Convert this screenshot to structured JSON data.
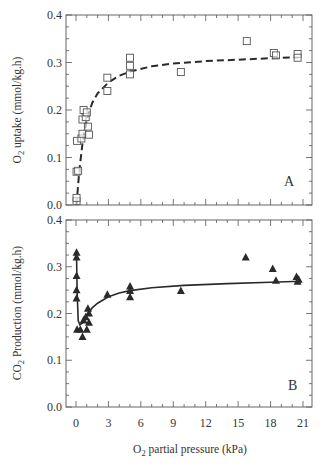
{
  "chart_data": [
    {
      "id": "A",
      "type": "scatter",
      "panel_label": "A",
      "title": "",
      "xlabel": "O2 partial pressure (kPa)",
      "ylabel": "O2 uptake (mmol/kg.h)",
      "xlim": [
        0,
        21
      ],
      "ylim": [
        0.0,
        0.4
      ],
      "yticks": [
        "0.0",
        "0.1",
        "0.2",
        "0.3",
        "0.4"
      ],
      "grid": false,
      "marker": "open-square",
      "fit_line": "dashed",
      "points": [
        {
          "x": 0.05,
          "y": 0.008
        },
        {
          "x": 0.05,
          "y": 0.015
        },
        {
          "x": 0.05,
          "y": 0.07
        },
        {
          "x": 0.2,
          "y": 0.072
        },
        {
          "x": 0.1,
          "y": 0.135
        },
        {
          "x": 0.5,
          "y": 0.14
        },
        {
          "x": 0.6,
          "y": 0.18
        },
        {
          "x": 0.6,
          "y": 0.15
        },
        {
          "x": 0.7,
          "y": 0.2
        },
        {
          "x": 0.9,
          "y": 0.185
        },
        {
          "x": 1.0,
          "y": 0.195
        },
        {
          "x": 1.1,
          "y": 0.165
        },
        {
          "x": 1.2,
          "y": 0.148
        },
        {
          "x": 2.9,
          "y": 0.268
        },
        {
          "x": 2.9,
          "y": 0.24
        },
        {
          "x": 5.0,
          "y": 0.31
        },
        {
          "x": 5.0,
          "y": 0.293
        },
        {
          "x": 5.0,
          "y": 0.275
        },
        {
          "x": 9.7,
          "y": 0.28
        },
        {
          "x": 15.8,
          "y": 0.345
        },
        {
          "x": 18.3,
          "y": 0.32
        },
        {
          "x": 18.5,
          "y": 0.315
        },
        {
          "x": 20.5,
          "y": 0.318
        },
        {
          "x": 20.5,
          "y": 0.31
        }
      ],
      "fit_curve": [
        {
          "x": 0.05,
          "y": 0.0
        },
        {
          "x": 0.3,
          "y": 0.07
        },
        {
          "x": 0.6,
          "y": 0.13
        },
        {
          "x": 1.0,
          "y": 0.18
        },
        {
          "x": 1.5,
          "y": 0.215
        },
        {
          "x": 2.0,
          "y": 0.235
        },
        {
          "x": 3.0,
          "y": 0.258
        },
        {
          "x": 4.0,
          "y": 0.272
        },
        {
          "x": 5.0,
          "y": 0.281
        },
        {
          "x": 7.0,
          "y": 0.292
        },
        {
          "x": 9.0,
          "y": 0.298
        },
        {
          "x": 12.0,
          "y": 0.303
        },
        {
          "x": 15.0,
          "y": 0.306
        },
        {
          "x": 18.0,
          "y": 0.309
        },
        {
          "x": 20.6,
          "y": 0.311
        }
      ]
    },
    {
      "id": "B",
      "type": "scatter",
      "panel_label": "B",
      "title": "",
      "xlabel": "O2 partial pressure (kPa)",
      "ylabel": "CO2 Production (mmol/kg.h)",
      "xlim": [
        0,
        21
      ],
      "ylim": [
        0.0,
        0.4
      ],
      "xticks": [
        "0",
        "3",
        "6",
        "9",
        "12",
        "15",
        "18",
        "21"
      ],
      "yticks": [
        "0.0",
        "0.1",
        "0.2",
        "0.3",
        "0.4"
      ],
      "grid": false,
      "marker": "filled-triangle",
      "fit_line": "solid",
      "points": [
        {
          "x": 0.05,
          "y": 0.33
        },
        {
          "x": 0.05,
          "y": 0.32
        },
        {
          "x": 0.05,
          "y": 0.28
        },
        {
          "x": 0.05,
          "y": 0.25
        },
        {
          "x": 0.05,
          "y": 0.232
        },
        {
          "x": 0.1,
          "y": 0.165
        },
        {
          "x": 0.4,
          "y": 0.165
        },
        {
          "x": 0.7,
          "y": 0.185
        },
        {
          "x": 0.6,
          "y": 0.15
        },
        {
          "x": 0.9,
          "y": 0.192
        },
        {
          "x": 1.0,
          "y": 0.165
        },
        {
          "x": 1.1,
          "y": 0.21
        },
        {
          "x": 1.2,
          "y": 0.2
        },
        {
          "x": 1.2,
          "y": 0.18
        },
        {
          "x": 2.9,
          "y": 0.24
        },
        {
          "x": 5.0,
          "y": 0.258
        },
        {
          "x": 5.0,
          "y": 0.248
        },
        {
          "x": 5.0,
          "y": 0.235
        },
        {
          "x": 9.7,
          "y": 0.248
        },
        {
          "x": 15.7,
          "y": 0.32
        },
        {
          "x": 18.2,
          "y": 0.295
        },
        {
          "x": 18.5,
          "y": 0.27
        },
        {
          "x": 20.4,
          "y": 0.278
        },
        {
          "x": 20.6,
          "y": 0.272
        },
        {
          "x": 20.5,
          "y": 0.268
        }
      ],
      "fit_curve": [
        {
          "x": 0.05,
          "y": 0.33
        },
        {
          "x": 0.1,
          "y": 0.25
        },
        {
          "x": 0.2,
          "y": 0.185
        },
        {
          "x": 0.35,
          "y": 0.176
        },
        {
          "x": 0.6,
          "y": 0.18
        },
        {
          "x": 1.0,
          "y": 0.197
        },
        {
          "x": 1.5,
          "y": 0.212
        },
        {
          "x": 2.0,
          "y": 0.222
        },
        {
          "x": 3.0,
          "y": 0.236
        },
        {
          "x": 4.0,
          "y": 0.244
        },
        {
          "x": 5.0,
          "y": 0.249
        },
        {
          "x": 7.0,
          "y": 0.255
        },
        {
          "x": 10.0,
          "y": 0.26
        },
        {
          "x": 14.0,
          "y": 0.264
        },
        {
          "x": 18.0,
          "y": 0.267
        },
        {
          "x": 20.8,
          "y": 0.269
        }
      ]
    }
  ],
  "labels": {
    "panelA_ylabel_main": "O",
    "panelA_ylabel_sub": "2",
    "panelA_ylabel_rest": " uptake (mmol/kg.h)",
    "panelB_ylabel_main": "CO",
    "panelB_ylabel_sub": "2",
    "panelB_ylabel_rest": " Production (mmol/kg.h)",
    "xlabel_main": "O",
    "xlabel_sub": "2",
    "xlabel_rest": " partial pressure (kPa)",
    "panelA_letter": "A",
    "panelB_letter": "B"
  },
  "colors": {
    "ink": "#2a2a2a",
    "frame": "#555555",
    "marker_open": "#555555",
    "background": "#ffffff"
  }
}
